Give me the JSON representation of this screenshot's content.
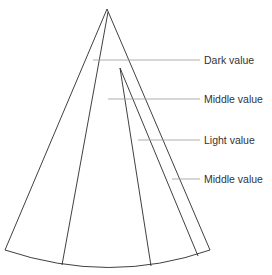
{
  "diagram": {
    "type": "cone-value-study",
    "colors": {
      "stroke": "#2a2a2a",
      "leader": "#9a9a9a",
      "text": "#333333"
    },
    "labels": [
      {
        "text": "Dark value",
        "y": 60
      },
      {
        "text": "Middle value",
        "y": 99
      },
      {
        "text": "Light value",
        "y": 140
      },
      {
        "text": "Middle value",
        "y": 179
      }
    ]
  }
}
